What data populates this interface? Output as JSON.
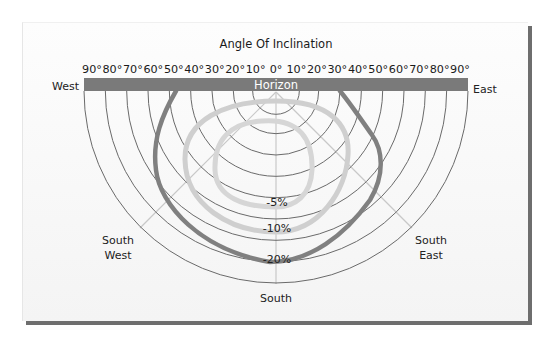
{
  "title": "Angle Of Inclination",
  "tick_labels": [
    "90°",
    "80°",
    "70°",
    "60°",
    "50°",
    "40°",
    "30°",
    "20°",
    "10°",
    "0°",
    "10°",
    "20°",
    "30°",
    "40°",
    "50°",
    "60°",
    "70°",
    "80°",
    "90°"
  ],
  "horizon_label": "Horizon",
  "compass": {
    "west": "West",
    "east": "East",
    "south": "South",
    "south_west": [
      "South",
      "West"
    ],
    "south_east": [
      "South",
      "East"
    ]
  },
  "loss_curves": [
    {
      "label": "-5%",
      "color": "#cfcfcf"
    },
    {
      "label": "-10%",
      "color": "#cfcfcf"
    },
    {
      "label": "-20%",
      "color": "#808080"
    }
  ],
  "colors": {
    "horizon_bar": "#7a7a7a",
    "grid_arcs": "#6a6a6a",
    "radial_lines": "#c8c8c8",
    "card_shadow": "#6e6e6e"
  }
}
